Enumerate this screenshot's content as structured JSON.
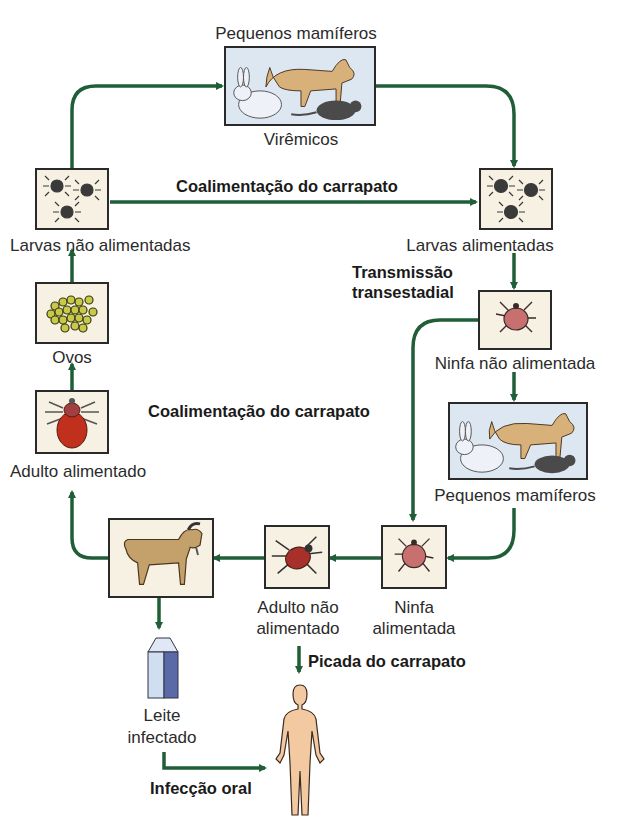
{
  "colors": {
    "arrow": "#1f5e36",
    "box_border": "#2a2a2a",
    "box_fill": "#f6f1e2",
    "mammal_box_fill": "#dde7f2"
  },
  "nodes": {
    "pequenos_mamiferos_top": {
      "label": "Pequenos mamíferos",
      "sublabel": "Virêmicos",
      "icon": "small-mammals-icon"
    },
    "larvas_nao_alimentadas": {
      "label": "Larvas não alimentadas",
      "icon": "tick-larvae-icon"
    },
    "larvas_alimentadas": {
      "label": "Larvas alimentadas",
      "icon": "tick-larvae-icon"
    },
    "ovos": {
      "label": "Ovos",
      "icon": "tick-eggs-icon"
    },
    "adulto_alimentado": {
      "label": "Adulto alimentado",
      "icon": "engorged-tick-icon"
    },
    "ninfa_nao_alimentada": {
      "label": "Ninfa não alimentada",
      "icon": "nymph-tick-icon"
    },
    "pequenos_mamiferos_right": {
      "label": "Pequenos mamíferos",
      "icon": "small-mammals-icon"
    },
    "cabra": {
      "label": "",
      "icon": "goat-icon"
    },
    "adulto_nao_alimentado": {
      "label_line1": "Adulto não",
      "label_line2": "alimentado",
      "icon": "adult-tick-icon"
    },
    "ninfa_alimentada": {
      "label_line1": "Ninfa",
      "label_line2": "alimentada",
      "icon": "nymph-tick-icon"
    },
    "leite_infectado": {
      "label_line1": "Leite",
      "label_line2": "infectado",
      "icon": "milk-carton-icon"
    },
    "humano": {
      "label": "",
      "icon": "human-figure-icon"
    }
  },
  "edge_labels": {
    "coalimentacao_top": "Coalimentação do carrapato",
    "transmissao_line1": "Transmissão",
    "transmissao_line2": "transestadial",
    "coalimentacao_mid": "Coalimentação do carrapato",
    "picada": "Picada do carrapato",
    "infeccao_oral": "Infecção oral"
  }
}
